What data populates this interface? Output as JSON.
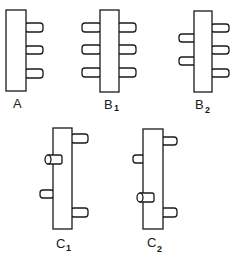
{
  "figure": {
    "panels": [
      {
        "id": "A",
        "label": "A",
        "subscript": "",
        "pegs_left": 0,
        "pegs_right": 3,
        "pegs_front": 0
      },
      {
        "id": "B1",
        "label": "B",
        "subscript": "1",
        "pegs_left": 3,
        "pegs_right": 3,
        "pegs_front": 0
      },
      {
        "id": "B2",
        "label": "B",
        "subscript": "2",
        "pegs_left": 2,
        "pegs_right": 3,
        "pegs_front": 0
      },
      {
        "id": "C1",
        "label": "C",
        "subscript": "1",
        "pegs_left": 1,
        "pegs_right": 2,
        "pegs_front": 1
      },
      {
        "id": "C2",
        "label": "C",
        "subscript": "2",
        "pegs_left": 1,
        "pegs_right": 2,
        "pegs_front": 1
      }
    ]
  },
  "colors": {
    "line": "#1a1a1a",
    "background": "#ffffff"
  }
}
